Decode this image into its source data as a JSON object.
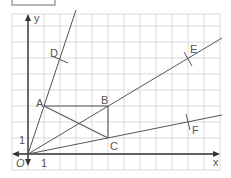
{
  "diagram": {
    "axes": {
      "x_label": "x",
      "y_label": "y",
      "origin_label": "O",
      "x_unit_label": "1",
      "y_unit_label": "1"
    },
    "grid": {
      "unit_px": 16,
      "origin_px": [
        28,
        154
      ],
      "x_range": [
        -1,
        12
      ],
      "y_range": [
        -1,
        8
      ]
    },
    "points": [
      {
        "name": "A",
        "label": "A",
        "coords": [
          1,
          3
        ]
      },
      {
        "name": "B",
        "label": "B",
        "coords": [
          5,
          3
        ]
      },
      {
        "name": "C",
        "label": "C",
        "coords": [
          5,
          1
        ]
      },
      {
        "name": "D",
        "label": "D",
        "coords": [
          2,
          6
        ]
      },
      {
        "name": "E",
        "label": "E",
        "coords": [
          10,
          6
        ]
      },
      {
        "name": "F",
        "label": "F",
        "coords": [
          10,
          2
        ]
      }
    ],
    "rays": [
      "OA",
      "OB",
      "OC"
    ],
    "segments": [
      "AB",
      "BC",
      "AC"
    ],
    "colors": {
      "grid": "#cfcfcf",
      "lines": "#555555",
      "axes": "#333333"
    }
  }
}
